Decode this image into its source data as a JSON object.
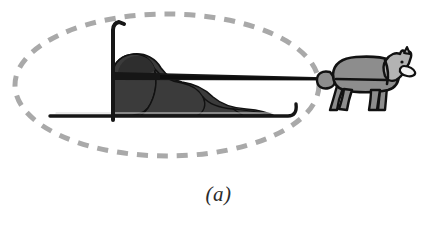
{
  "figure": {
    "name": "dog-sled-diagram",
    "caption": "(a)",
    "width": 437,
    "height": 228,
    "background_color": "#ffffff"
  },
  "colors": {
    "background": "#ffffff",
    "ellipse_dash": "#a9a9a9",
    "outline_dark": "#161616",
    "cargo_fill": "#3b3b3b",
    "cargo_fill_dark": "#2e2e2e",
    "sled_runner": "#161616",
    "dog_body": "#8d8d8d",
    "dog_head": "#b3b3b3",
    "dog_muzzle": "#f2f2f2",
    "caption_text": "#2b2b2b"
  },
  "elements": {
    "boundary_ellipse": {
      "label": "dashed-boundary-ellipse",
      "center_x": 167,
      "center_y": 85,
      "radius_x": 152,
      "radius_y": 71,
      "stroke_width": 5,
      "dash_pattern": "11 9",
      "style": "dashed"
    },
    "sled": {
      "label": "sled",
      "runner_y": 116,
      "runner_x_start": 50,
      "runner_x_end": 288,
      "runner_tip_x": 296,
      "runner_tip_y": 104,
      "handle_post_x": 113,
      "handle_post_top_y": 22,
      "handle_post_bottom_y": 120,
      "handle_kick_x": 124,
      "handle_kick_y": 24
    },
    "cargo": {
      "label": "sled-cargo-load",
      "x_start": 113,
      "x_end": 276,
      "y_top": 54,
      "y_bottom": 116,
      "segments": 5
    },
    "tow_line": {
      "label": "tow-line",
      "x_start": 113,
      "y_start": 76,
      "x_end": 334,
      "y_end": 79,
      "thickness_start": 7,
      "thickness_end": 3
    },
    "dog": {
      "label": "sled-dog",
      "x_start": 322,
      "x_end": 412,
      "y_top": 54,
      "y_bottom": 111,
      "facing": "right",
      "harness_visible": true,
      "legs": 4
    }
  }
}
